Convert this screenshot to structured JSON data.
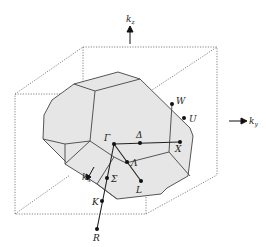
{
  "colors": {
    "face_fill": "#e6e6e6",
    "edge": "#555555",
    "cube_dotted": "#666666",
    "path_line": "#222222",
    "point": "#111111"
  },
  "axes": {
    "kz": {
      "base": "k",
      "sub": "z"
    },
    "ky": {
      "base": "k",
      "sub": "y"
    },
    "kx": {
      "base": "k",
      "sub": "x"
    }
  },
  "points": [
    {
      "id": "Gamma",
      "label": "Γ"
    },
    {
      "id": "Delta",
      "label": "Δ"
    },
    {
      "id": "X",
      "label": "X"
    },
    {
      "id": "Lambda",
      "label": "Λ"
    },
    {
      "id": "L",
      "label": "L"
    },
    {
      "id": "Sigma",
      "label": "Σ"
    },
    {
      "id": "K",
      "label": "K"
    },
    {
      "id": "R",
      "label": "R"
    },
    {
      "id": "W",
      "label": "W"
    },
    {
      "id": "U",
      "label": "U"
    }
  ]
}
